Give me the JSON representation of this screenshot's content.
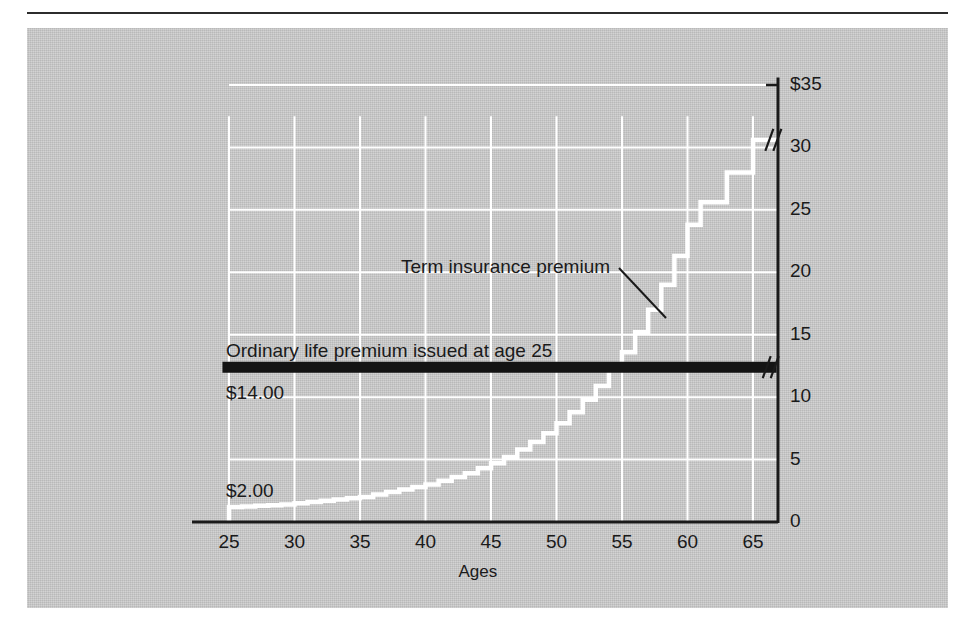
{
  "figure": {
    "background_color": "#c9c9c9",
    "page_color": "#ffffff",
    "rule_color": "#2c2c2c",
    "series_color": "#ffffff",
    "ordinary_bar_color": "#141414",
    "grid_color": "#ffffff",
    "axis_color": "#1a1a1a"
  },
  "chart_data": {
    "type": "line",
    "title": "",
    "subtitle": "",
    "xlabel": "Ages",
    "ylabel": "",
    "xlim": [
      23,
      67
    ],
    "ylim": [
      0,
      36
    ],
    "grid": true,
    "legend_position": "inline-annotation",
    "x_ticks": [
      25,
      30,
      35,
      40,
      45,
      50,
      55,
      60,
      65
    ],
    "x_tick_labels": [
      "25",
      "30",
      "35",
      "40",
      "45",
      "50",
      "55",
      "60",
      "65"
    ],
    "y_ticks": [
      0,
      5,
      10,
      15,
      20,
      25,
      30,
      35
    ],
    "y_tick_labels": [
      "0",
      "5",
      "10",
      "15",
      "20",
      "25",
      "30",
      "$35"
    ],
    "series": [
      {
        "name": "Term insurance premium",
        "style": "step",
        "color": "#ffffff",
        "x": [
          25,
          26,
          27,
          28,
          29,
          30,
          31,
          32,
          33,
          34,
          35,
          36,
          37,
          38,
          39,
          40,
          41,
          42,
          43,
          44,
          45,
          46,
          47,
          48,
          49,
          50,
          51,
          52,
          53,
          54,
          55,
          56,
          57,
          58,
          59,
          60,
          61,
          62,
          63,
          64,
          65,
          66
        ],
        "values": [
          1.2,
          1.25,
          1.3,
          1.35,
          1.4,
          1.5,
          1.6,
          1.7,
          1.8,
          1.9,
          2.0,
          2.2,
          2.4,
          2.6,
          2.8,
          3.0,
          3.3,
          3.6,
          3.9,
          4.3,
          4.7,
          5.2,
          5.8,
          6.4,
          7.1,
          7.9,
          8.8,
          9.8,
          10.9,
          12.2,
          13.6,
          15.2,
          17.0,
          19.0,
          21.3,
          23.8,
          25.6,
          25.6,
          28.0,
          28.0,
          30.6,
          30.6
        ]
      },
      {
        "name": "Ordinary life premium issued at age 25",
        "style": "horizontal-line",
        "color": "#141414",
        "value": 12.4,
        "x_start": 24.5,
        "x_end": 66.8
      }
    ],
    "annotations": [
      {
        "name": "term-premium-label",
        "text": "Term insurance premium",
        "x": 43.5,
        "y": 20.5,
        "leader": true
      },
      {
        "name": "ordinary-premium-label",
        "text": "Ordinary life premium issued at age 25",
        "x": 25.0,
        "y": 13.6,
        "leader": false
      },
      {
        "name": "ordinary-premium-value",
        "text": "$14.00",
        "x": 25.0,
        "y": 11.1,
        "leader": false
      },
      {
        "name": "term-premium-start-value",
        "text": "$2.00",
        "x": 25.0,
        "y": 2.4,
        "leader": false
      }
    ],
    "axis_break_marks": [
      {
        "name": "term-series-break",
        "on": "Term insurance premium",
        "x": 66.4,
        "y": 30.6
      },
      {
        "name": "ordinary-line-break",
        "on": "Ordinary life premium issued at age 25",
        "x": 66.2,
        "y": 12.4
      }
    ]
  },
  "labels": {
    "x_axis_title": "Ages",
    "x_ticks": [
      "25",
      "30",
      "35",
      "40",
      "45",
      "50",
      "55",
      "60",
      "65"
    ],
    "y_ticks": [
      "0",
      "5",
      "10",
      "15",
      "20",
      "25",
      "30",
      "$35"
    ],
    "term_annotation": "Term insurance premium",
    "ordinary_annotation": "Ordinary life premium issued at age 25",
    "ordinary_value": "$14.00",
    "term_start_value": "$2.00"
  }
}
